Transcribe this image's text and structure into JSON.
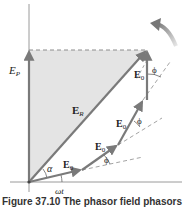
{
  "figure": {
    "labels": {
      "ep": "E",
      "ep_sub": "P",
      "er": "E",
      "er_sub": "R",
      "e0": "E",
      "e0_sub": "0",
      "alpha": "α",
      "phi": "ϕ",
      "omega_t": "ωt"
    },
    "caption": "Figure 37.10 The phasor field phasors",
    "colors": {
      "vector": "#7a7a7a",
      "shade": "#e4e4e4",
      "axis": "#9a9a9a",
      "dashed": "#8c8c8c",
      "rotation_arrow": "#888888"
    }
  }
}
